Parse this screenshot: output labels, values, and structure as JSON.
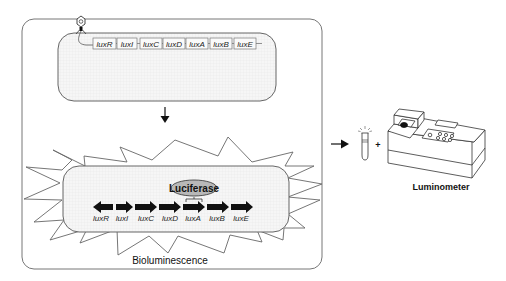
{
  "plasmid": {
    "genes": [
      "luxR",
      "luxI",
      "luxC",
      "luxD",
      "luxA",
      "luxB",
      "luxE"
    ]
  },
  "cell": {
    "genes": [
      "luxR",
      "luxI",
      "luxC",
      "luxD",
      "luxA",
      "luxB",
      "luxE"
    ],
    "enzyme_label": "Luciferase",
    "caption": "Bioluminescence"
  },
  "instrument": {
    "plus_sign": "+",
    "label": "Luminometer"
  },
  "colors": {
    "stroke": "#555555",
    "arrow_fill": "#111111",
    "cell_fill": "#f3f3f3",
    "enzyme_fill": "#b8b8b8"
  }
}
